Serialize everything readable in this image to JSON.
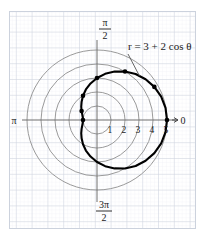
{
  "figure": {
    "type": "polar-plot",
    "background_color": "#ffffff",
    "graph_paper_color": "#d8dce4",
    "polar_grid_color": "#8a8a8a",
    "curve_color": "#000000",
    "axis_color": "#6e6e6e"
  },
  "chart_data": {
    "type": "line",
    "coordinate_system": "polar",
    "title": "",
    "equation_label": "r = 3 + 2 cos θ",
    "equation_parts": {
      "r": "r",
      "equals": "=",
      "a": "3",
      "plus": "+",
      "b": "2",
      "trig": "cos",
      "theta": "θ"
    },
    "curve_name": "limaçon",
    "radial_ticks": [
      1,
      2,
      3,
      4,
      5
    ],
    "radial_tick_labels": [
      "1",
      "2",
      "3",
      "4",
      "5"
    ],
    "rlim": [
      0,
      5
    ],
    "angle_labels": [
      {
        "name": "zero",
        "text": "0",
        "angle_deg": 0
      },
      {
        "name": "pi-over-two",
        "numerator": "π",
        "denominator": "2",
        "angle_deg": 90
      },
      {
        "name": "pi",
        "text": "π",
        "angle_deg": 180
      },
      {
        "name": "three-pi-over-two",
        "numerator": "3π",
        "denominator": "2",
        "angle_deg": 270
      }
    ],
    "grid": true,
    "legend": "none",
    "marked_points": [
      {
        "theta_deg": 0,
        "r": 5.0
      },
      {
        "theta_deg": 30,
        "r": 4.73
      },
      {
        "theta_deg": 60,
        "r": 4.0
      },
      {
        "theta_deg": 90,
        "r": 3.0
      },
      {
        "theta_deg": 120,
        "r": 2.0
      },
      {
        "theta_deg": 150,
        "r": 1.27
      },
      {
        "theta_deg": 180,
        "r": 1.0
      }
    ],
    "series": [
      {
        "name": "r = 3 + 2 cos theta",
        "formula_a": 3,
        "formula_b": 2,
        "theta_deg": [
          0,
          10,
          20,
          30,
          40,
          50,
          60,
          70,
          80,
          90,
          100,
          110,
          120,
          130,
          140,
          150,
          160,
          170,
          180,
          190,
          200,
          210,
          220,
          230,
          240,
          250,
          260,
          270,
          280,
          290,
          300,
          310,
          320,
          330,
          340,
          350,
          360
        ],
        "r": [
          5.0,
          4.97,
          4.88,
          4.73,
          4.53,
          4.29,
          4.0,
          3.68,
          3.35,
          3.0,
          2.65,
          2.32,
          2.0,
          1.71,
          1.47,
          1.27,
          1.12,
          1.03,
          1.0,
          1.03,
          1.12,
          1.27,
          1.47,
          1.71,
          2.0,
          2.32,
          2.65,
          3.0,
          3.35,
          3.68,
          4.0,
          4.29,
          4.53,
          4.73,
          4.88,
          4.97,
          5.0
        ]
      }
    ]
  }
}
